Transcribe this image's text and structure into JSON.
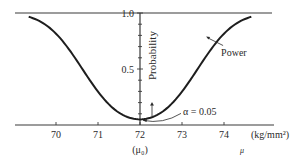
{
  "chart_data": {
    "type": "line",
    "title": "",
    "xlabel": "μ",
    "x_unit_label": "(kg/mm²)",
    "ylabel": "Probability",
    "xlim": [
      69.0,
      75.2
    ],
    "ylim": [
      0,
      1.0
    ],
    "grid": false,
    "x_ticks": [
      70,
      71,
      72,
      73,
      74
    ],
    "x_tick_labels": [
      "70",
      "71",
      "72",
      "73",
      "74"
    ],
    "x_sub_label": {
      "at": 72,
      "text": "(μ₀)"
    },
    "y_ticks": [
      0.5,
      1.0
    ],
    "y_tick_labels": [
      "0.5",
      "1.0"
    ],
    "y_minor_ticks": [
      0.1,
      0.2,
      0.3,
      0.4,
      0.6,
      0.7,
      0.8,
      0.9
    ],
    "reference_line": {
      "y": 1.0
    },
    "series": [
      {
        "name": "Power",
        "x": [
          69.0,
          69.5,
          70.0,
          70.5,
          71.0,
          71.5,
          72.0,
          72.5,
          73.0,
          73.5,
          74.0,
          74.5,
          75.0
        ],
        "y": [
          0.999,
          0.99,
          0.946,
          0.815,
          0.573,
          0.298,
          0.05,
          0.298,
          0.573,
          0.815,
          0.946,
          0.99,
          0.999
        ]
      }
    ],
    "annotations": [
      {
        "text": "Power",
        "points_to": {
          "x": 73.55,
          "y": 0.79
        }
      },
      {
        "text": "α = 0.05",
        "points_to": {
          "x": 72.0,
          "y": 0.05
        }
      },
      {
        "text": "↑",
        "meaning": "probability-direction-arrow"
      }
    ]
  }
}
